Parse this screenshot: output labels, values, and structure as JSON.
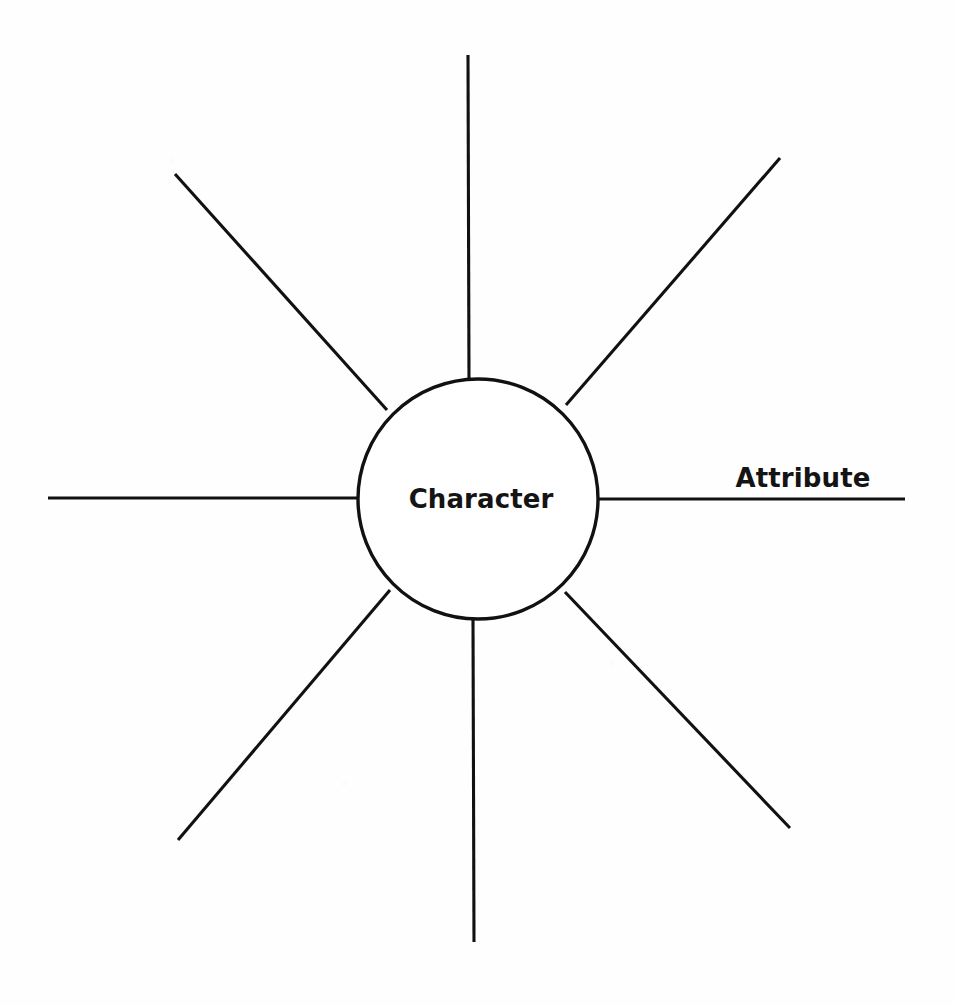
{
  "page": {
    "kind": "graphic-organizer",
    "background_color": "#fefefe",
    "ink_color": "#111111",
    "width": 956,
    "height": 1005
  },
  "hub": {
    "label": "Character",
    "center_x": 478,
    "center_y": 499,
    "radius": 120,
    "stroke_width": 3.4,
    "fill": "#ffffff"
  },
  "spokes": [
    {
      "id": "north",
      "name": "spoke-north",
      "label": "",
      "angle_deg": 270,
      "x1": 469,
      "y1": 379,
      "x2": 468,
      "y2": 55
    },
    {
      "id": "northeast",
      "name": "spoke-northeast",
      "label": "",
      "angle_deg": 315,
      "x1": 566,
      "y1": 405,
      "x2": 780,
      "y2": 158
    },
    {
      "id": "east",
      "name": "spoke-east",
      "label": "Attribute",
      "angle_deg": 0,
      "x1": 598,
      "y1": 499,
      "x2": 905,
      "y2": 499,
      "label_x": 803,
      "label_y": 487
    },
    {
      "id": "southeast",
      "name": "spoke-southeast",
      "label": "",
      "angle_deg": 45,
      "x1": 565,
      "y1": 592,
      "x2": 790,
      "y2": 828
    },
    {
      "id": "south",
      "name": "spoke-south",
      "label": "",
      "angle_deg": 90,
      "x1": 473,
      "y1": 620,
      "x2": 474,
      "y2": 942
    },
    {
      "id": "southwest",
      "name": "spoke-southwest",
      "label": "",
      "angle_deg": 135,
      "x1": 390,
      "y1": 590,
      "x2": 178,
      "y2": 840
    },
    {
      "id": "west",
      "name": "spoke-west",
      "label": "",
      "angle_deg": 180,
      "x1": 359,
      "y1": 498,
      "x2": 48,
      "y2": 498
    },
    {
      "id": "northwest",
      "name": "spoke-northwest",
      "label": "",
      "angle_deg": 225,
      "x1": 387,
      "y1": 410,
      "x2": 175,
      "y2": 174
    }
  ],
  "labels": {
    "hub": "Character",
    "attribute": "Attribute"
  }
}
